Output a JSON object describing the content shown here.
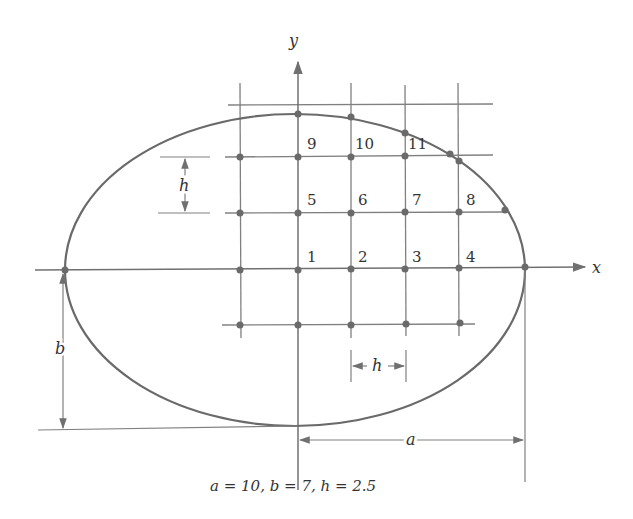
{
  "figure": {
    "axes": {
      "x_label": "x",
      "y_label": "y"
    },
    "node_labels": [
      "1",
      "2",
      "3",
      "4",
      "5",
      "6",
      "7",
      "8",
      "9",
      "10",
      "11"
    ],
    "dimension_labels": {
      "a": "a",
      "b": "b",
      "h_vertical": "h",
      "h_horizontal": "h"
    },
    "caption": "a = 10, b = 7, h = 2.5",
    "parameters": {
      "a": 10,
      "b": 7,
      "h": 2.5
    },
    "colors": {
      "line": "#707070",
      "curve": "#6a6a6a",
      "node": "#6a6a6a",
      "text": "#333333"
    }
  }
}
